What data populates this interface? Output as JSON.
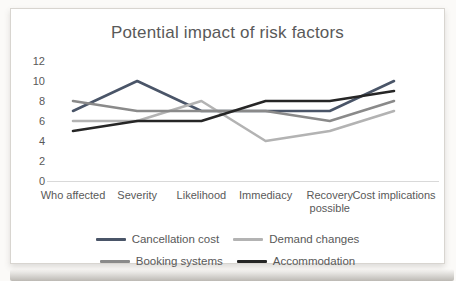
{
  "chart_data": {
    "type": "line",
    "title": "Potential impact of risk factors",
    "categories": [
      "Who affected",
      "Severity",
      "Likelihood",
      "Immediacy",
      "Recovery possible",
      "Cost implications"
    ],
    "series": [
      {
        "name": "Cancellation cost",
        "color": "#4a5568",
        "values": [
          7,
          10,
          7,
          7,
          7,
          10
        ]
      },
      {
        "name": "Demand changes",
        "color": "#b3b3b3",
        "values": [
          6,
          6,
          8,
          4,
          5,
          7
        ]
      },
      {
        "name": "Booking systems",
        "color": "#8a8a8a",
        "values": [
          8,
          7,
          7,
          7,
          6,
          8
        ]
      },
      {
        "name": "Accommodation",
        "color": "#262626",
        "values": [
          5,
          6,
          6,
          8,
          8,
          9
        ]
      }
    ],
    "y_axis": {
      "min": 0,
      "max": 12,
      "step": 2,
      "ticks": [
        12,
        10,
        8,
        6,
        4,
        2,
        0
      ]
    },
    "xlabel": "",
    "ylabel": "",
    "grid": false,
    "legend_position": "bottom",
    "axis_color": "#d9d9d9",
    "text_color": "#595959"
  }
}
